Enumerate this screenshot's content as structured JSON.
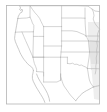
{
  "figure": {
    "kind": "outline-map",
    "title": "",
    "caption": "",
    "region_label": "Western and Central United States",
    "background_color": "#ffffff",
    "frame_color": "#b4b4b4",
    "border_color": "#b0b0b0",
    "coast_color": "#a8a8a8",
    "shade_color": "#e3e3e3",
    "width_px": 107,
    "height_px": 112
  },
  "frame": {
    "left": 6.5,
    "top": 5.5,
    "right": 99.5,
    "bottom": 104.0,
    "stroke_width": 0.8
  },
  "map": {
    "projection_hint": "plate-carree",
    "lon_min": -126.0,
    "lon_max": -92.0,
    "lat_min": 24.0,
    "lat_max": 50.0,
    "features": {
      "state_boundaries": true,
      "coastline": true,
      "country_boundaries": true,
      "shaded_eastern_margin": true,
      "labels": false,
      "graticule": false,
      "legend": false
    }
  },
  "states_visible": [
    {
      "code": "WA",
      "name": "Washington"
    },
    {
      "code": "OR",
      "name": "Oregon"
    },
    {
      "code": "CA",
      "name": "California"
    },
    {
      "code": "ID",
      "name": "Idaho"
    },
    {
      "code": "NV",
      "name": "Nevada"
    },
    {
      "code": "UT",
      "name": "Utah"
    },
    {
      "code": "AZ",
      "name": "Arizona"
    },
    {
      "code": "MT",
      "name": "Montana"
    },
    {
      "code": "WY",
      "name": "Wyoming"
    },
    {
      "code": "CO",
      "name": "Colorado"
    },
    {
      "code": "NM",
      "name": "New Mexico"
    },
    {
      "code": "ND",
      "name": "North Dakota"
    },
    {
      "code": "SD",
      "name": "South Dakota"
    },
    {
      "code": "NE",
      "name": "Nebraska"
    },
    {
      "code": "KS",
      "name": "Kansas"
    },
    {
      "code": "OK",
      "name": "Oklahoma"
    },
    {
      "code": "TX",
      "name": "Texas"
    },
    {
      "code": "MN",
      "name": "Minnesota"
    },
    {
      "code": "IA",
      "name": "Iowa"
    },
    {
      "code": "MO",
      "name": "Missouri"
    },
    {
      "code": "AR",
      "name": "Arkansas"
    },
    {
      "code": "LA",
      "name": "Louisiana"
    }
  ]
}
